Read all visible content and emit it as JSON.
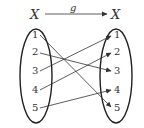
{
  "diagram": {
    "function_label": "g",
    "domain": {
      "label": "X",
      "elements": [
        "1",
        "2",
        "3",
        "4",
        "5"
      ]
    },
    "codomain": {
      "label": "X",
      "elements": [
        "1",
        "2",
        "3",
        "4",
        "5"
      ]
    },
    "mapping": [
      {
        "from": "1",
        "to": "5"
      },
      {
        "from": "2",
        "to": "3"
      },
      {
        "from": "3",
        "to": "1"
      },
      {
        "from": "4",
        "to": "2"
      },
      {
        "from": "5",
        "to": "4"
      }
    ],
    "colors": {
      "stroke": "#333333",
      "background": "#ffffff"
    }
  }
}
